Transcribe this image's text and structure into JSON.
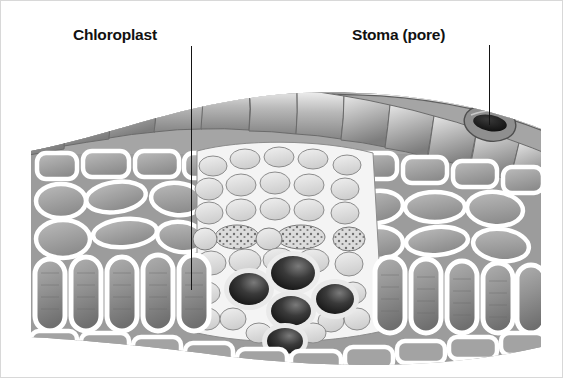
{
  "figure": {
    "style": "grayscale pencil/wash scientific illustration",
    "background_color": "#ffffff",
    "ink_color": "#151515",
    "canvas": {
      "width": 563,
      "height": 378
    }
  },
  "labels": [
    {
      "id": "chloroplast",
      "text": "Chloroplast",
      "x": 72,
      "y": 25,
      "font_weight": "bold",
      "font_size_px": 15.5,
      "color": "#111111",
      "leader": {
        "x": 190,
        "y_start": 45,
        "y_end": 289,
        "orientation": "vertical"
      },
      "points_to": "a palisade mesophyll cell in the lower palisade layer"
    },
    {
      "id": "stoma",
      "text": "Stoma (pore)",
      "x": 351,
      "y": 25,
      "font_weight": "bold",
      "font_size_px": 15.5,
      "color": "#111111",
      "leader": {
        "x": 488,
        "y_start": 44,
        "y_end": 124,
        "orientation": "vertical"
      },
      "points_to": "the stoma opening in the upper epidermis at right"
    }
  ],
  "tissues": [
    {
      "name": "upper-epidermis",
      "description": "single arched row of large puffy shaded cells forming the top surface",
      "y_range": [
        95,
        150
      ]
    },
    {
      "name": "stomata",
      "description": "two dark lens-shaped pores set into the upper epidermis",
      "count": 2
    },
    {
      "name": "spongy-mesophyll",
      "description": "loosely packed irregular rounded cells with thick white walls, left and right of the vein",
      "y_range": [
        150,
        250
      ]
    },
    {
      "name": "palisade-mesophyll",
      "description": "columnar capsule-shaped cells with horizontal striations",
      "y_range": [
        250,
        330
      ]
    },
    {
      "name": "bundle-sheath",
      "description": "dense cluster of small polygonal cells surrounding the central vein",
      "y_range": [
        145,
        340
      ]
    },
    {
      "name": "phloem",
      "description": "small cells with stippled speckled interiors above the xylem",
      "y_range": [
        210,
        255
      ]
    },
    {
      "name": "xylem-vessels",
      "description": "five dark thick-walled ring vessels with shaded lumens",
      "count": 5,
      "y_range": [
        255,
        340
      ]
    },
    {
      "name": "lower-epidermis",
      "description": "single row of brick-like cells curving gently downward across the bottom",
      "y_range": [
        325,
        360
      ]
    }
  ],
  "stomata_positions": [
    {
      "id": "stoma-left",
      "cx": 52,
      "cy": 124
    },
    {
      "id": "stoma-right",
      "cx": 489,
      "cy": 122
    }
  ]
}
